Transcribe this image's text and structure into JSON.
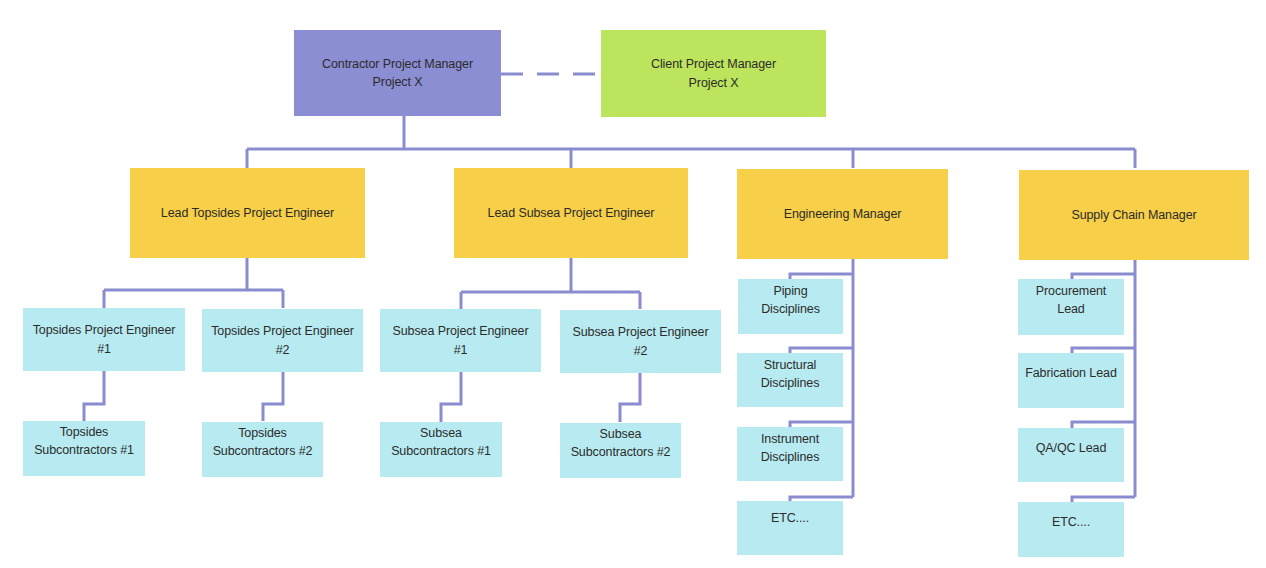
{
  "colors": {
    "connector": "#8a8cd0",
    "top_manager": "#8b8ed3",
    "client_manager": "#bde45d",
    "lead": "#f7cf48",
    "staff": "#b8ebf1"
  },
  "top": {
    "contractor_pm": "Contractor Project Manager\nProject X",
    "client_pm": "Client Project Manager\nProject X"
  },
  "leads": [
    {
      "label": "Lead Topsides Project Engineer"
    },
    {
      "label": "Lead Subsea Project Engineer"
    },
    {
      "label": "Engineering Manager"
    },
    {
      "label": "Supply Chain Manager"
    }
  ],
  "topsides": {
    "engineers": [
      "Topsides Project Engineer\n#1",
      "Topsides Project Engineer\n#2"
    ],
    "subcontractors": [
      "Topsides\nSubcontractors #1",
      "Topsides\nSubcontractors #2"
    ]
  },
  "subsea": {
    "engineers": [
      "Subsea Project Engineer\n#1",
      "Subsea Project Engineer\n#2"
    ],
    "subcontractors": [
      "Subsea\nSubcontractors #1",
      "Subsea\nSubcontractors #2"
    ]
  },
  "engineering": {
    "items": [
      "Piping\nDisciplines",
      "Structural\nDisciplines",
      "Instrument\nDisciplines",
      "ETC...."
    ]
  },
  "supply_chain": {
    "items": [
      "Procurement\nLead",
      "Fabrication Lead",
      "QA/QC Lead",
      "ETC...."
    ]
  }
}
